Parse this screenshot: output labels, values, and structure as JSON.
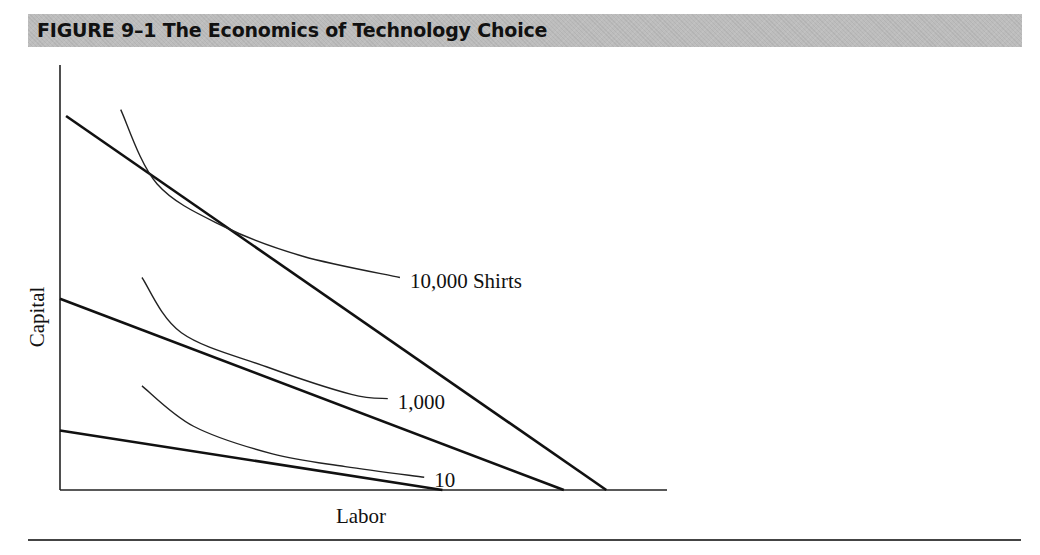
{
  "figure": {
    "title": "FIGURE 9–1  The Economics of Technology Choice"
  },
  "chart_data": {
    "type": "line",
    "title": "FIGURE 9–1  The Economics of Technology Choice",
    "xlabel": "Labor",
    "ylabel": "Capital",
    "grid": false,
    "ticks": "none",
    "axis_range": {
      "x": [
        0,
        100
      ],
      "y": [
        0,
        100
      ]
    },
    "isocost_lines": [
      {
        "name": "isocost-high",
        "from": [
          1,
          88
        ],
        "to": [
          90,
          0
        ]
      },
      {
        "name": "isocost-mid",
        "from": [
          0,
          45
        ],
        "to": [
          83,
          0
        ]
      },
      {
        "name": "isocost-low",
        "from": [
          0,
          14
        ],
        "to": [
          63,
          0
        ]
      }
    ],
    "isoquants": [
      {
        "name": "10,000 Shirts",
        "label": "10,000 Shirts",
        "points": [
          [
            10,
            89.5
          ],
          [
            16,
            72
          ],
          [
            27,
            62
          ],
          [
            40,
            55
          ],
          [
            56,
            50
          ]
        ]
      },
      {
        "name": "1,000",
        "label": "1,000",
        "points": [
          [
            13.5,
            50
          ],
          [
            20,
            37
          ],
          [
            34,
            29
          ],
          [
            48,
            22.5
          ],
          [
            54,
            21.5
          ]
        ]
      },
      {
        "name": "10",
        "label": "10",
        "points": [
          [
            13.5,
            24.5
          ],
          [
            22,
            15
          ],
          [
            35,
            8.5
          ],
          [
            47,
            5.5
          ],
          [
            60,
            3
          ]
        ]
      }
    ]
  }
}
